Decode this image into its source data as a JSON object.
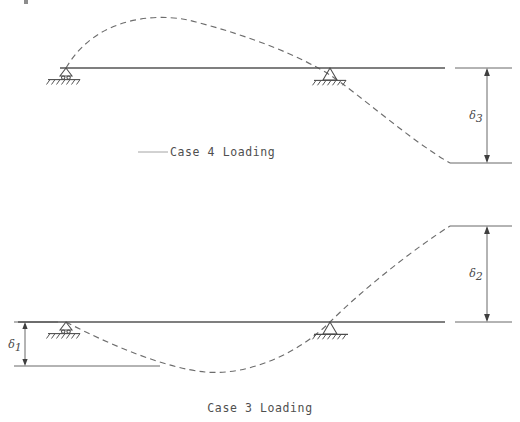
{
  "figure": {
    "background_color": "#ffffff",
    "line_color": "#555555",
    "dash_color": "#6d6d6d",
    "text_color": "#4a4a4a"
  },
  "panels": [
    {
      "id": "case4",
      "caption": "Case  4  Loading",
      "case_number": "4",
      "beam": {
        "start_x": 60,
        "end_x": 445,
        "y": 68
      },
      "supports": [
        {
          "name": "left-roller-support",
          "x": 66,
          "y": 68,
          "type": "roller"
        },
        {
          "name": "interior-pin-support",
          "x": 330,
          "y": 68,
          "type": "pin"
        }
      ],
      "deflection": {
        "description": "Upward hump between supports, downward droop past the interior support",
        "peak_x": 196,
        "peak_y": 22,
        "end_x": 450,
        "end_y": 163
      },
      "dimension": {
        "name": "delta-3",
        "symbol": "δ",
        "subscript": "3",
        "label": "δ3",
        "from_y": 68,
        "to_y": 163,
        "x": 487
      }
    },
    {
      "id": "case3",
      "caption": "Case  3  Loading",
      "case_number": "3",
      "beam": {
        "start_x": 18,
        "end_x": 445,
        "y": 322
      },
      "supports": [
        {
          "name": "left-pin-support",
          "x": 66,
          "y": 322,
          "type": "pin"
        },
        {
          "name": "interior-pin-support",
          "x": 330,
          "y": 322,
          "type": "pin"
        }
      ],
      "deflection": {
        "description": "Downward sag between supports, rising cantilever past the interior support",
        "trough_x": 205,
        "trough_y": 372,
        "end_x": 450,
        "end_y": 226
      },
      "dimensions": [
        {
          "name": "delta-1",
          "symbol": "δ",
          "subscript": "1",
          "label": "δ1",
          "from_y": 322,
          "to_y": 366,
          "x": 25,
          "position": "below-beam-left"
        },
        {
          "name": "delta-2",
          "symbol": "δ",
          "subscript": "2",
          "label": "δ2",
          "from_y": 226,
          "to_y": 322,
          "x": 487,
          "position": "above-beam-right"
        }
      ]
    }
  ]
}
